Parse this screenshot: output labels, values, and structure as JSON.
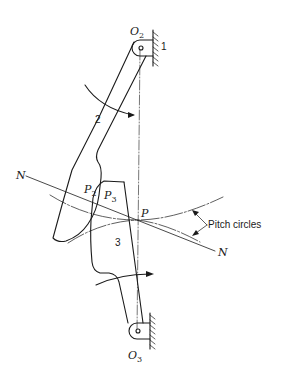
{
  "diagram": {
    "type": "kinematic-gear-tooth-contact",
    "labels": {
      "o2": {
        "base": "O",
        "sub": "2"
      },
      "o3": {
        "base": "O",
        "sub": "3"
      },
      "p2": {
        "base": "P",
        "sub": "2"
      },
      "p3": {
        "base": "P",
        "sub": "3"
      },
      "p": "P",
      "n_left": "N",
      "n_right": "N",
      "frame": "1",
      "link2": "2",
      "link3": "3",
      "pitch_circles": "Pitch circles"
    },
    "colors": {
      "stroke": "#1a1a1a",
      "background": "#ffffff"
    }
  }
}
